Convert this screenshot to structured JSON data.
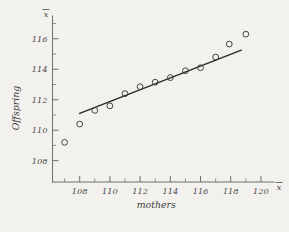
{
  "figure": {
    "background_color": "#f2f1ee",
    "ink_color": "#3a3a38",
    "line_color": "#2b2b2b"
  },
  "chart_data": {
    "type": "scatter",
    "title": "",
    "subtitle": "",
    "xlabel": "mothers",
    "ylabel": "Offspring",
    "x_axis_corner_symbol": "x",
    "y_axis_corner_symbol": "x",
    "xlim": [
      106.2,
      120.6
    ],
    "ylim": [
      106.6,
      117.1
    ],
    "xticks": [
      108,
      110,
      112,
      114,
      116,
      118,
      120
    ],
    "xticklabels": [
      "108",
      "110",
      "112",
      "114",
      "116",
      "118",
      "120"
    ],
    "xminorticks": [
      107,
      109,
      111,
      113,
      115,
      117,
      119
    ],
    "yticks": [
      108,
      110,
      112,
      114,
      116
    ],
    "yticklabels": [
      "108",
      "110",
      "112",
      "114",
      "116"
    ],
    "yminorticks": [
      109,
      111,
      113,
      115,
      117
    ],
    "grid": false,
    "legend": null,
    "marker_style": "open-circle",
    "points": [
      {
        "x": 107.0,
        "y": 109.2
      },
      {
        "x": 108.0,
        "y": 110.4
      },
      {
        "x": 109.0,
        "y": 111.3
      },
      {
        "x": 110.0,
        "y": 111.6
      },
      {
        "x": 111.0,
        "y": 112.4
      },
      {
        "x": 112.0,
        "y": 112.85
      },
      {
        "x": 113.0,
        "y": 113.15
      },
      {
        "x": 114.0,
        "y": 113.45
      },
      {
        "x": 115.0,
        "y": 113.9
      },
      {
        "x": 116.0,
        "y": 114.1
      },
      {
        "x": 117.0,
        "y": 114.8
      },
      {
        "x": 117.9,
        "y": 115.65
      },
      {
        "x": 119.0,
        "y": 116.3
      }
    ],
    "fit_line": {
      "type": "linear-regression",
      "x_start": 108.0,
      "y_start": 111.1,
      "x_end": 118.7,
      "y_end": 115.25
    }
  }
}
